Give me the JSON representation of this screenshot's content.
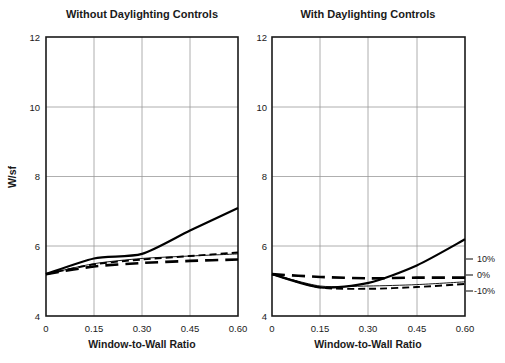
{
  "figure": {
    "width": 505,
    "height": 363,
    "background": "#ffffff",
    "ink_color": "#1a1a1a",
    "grid_color": "#9a9a9a"
  },
  "chart_data": [
    {
      "type": "line",
      "title": "Without Daylighting Controls",
      "xlabel": "Window-to-Wall Ratio",
      "ylabel": "W/sf",
      "xlim": [
        0,
        0.6
      ],
      "ylim": [
        4,
        12
      ],
      "xticks": [
        0,
        0.15,
        0.3,
        0.45,
        0.6
      ],
      "xticklabels": [
        "0",
        "0.15",
        "0.30",
        "0.45",
        "0.60"
      ],
      "yticks": [
        4,
        6,
        8,
        10,
        12
      ],
      "yticklabels": [
        "4",
        "6",
        "8",
        "10",
        "12"
      ],
      "grid": true,
      "legend": "none",
      "x": [
        0,
        0.15,
        0.3,
        0.45,
        0.6
      ],
      "series": [
        {
          "name": "thick-solid",
          "style": "thick-solid",
          "values": [
            5.2,
            5.65,
            5.78,
            6.45,
            7.1
          ]
        },
        {
          "name": "thin-solid",
          "style": "thin-solid",
          "values": [
            5.2,
            5.5,
            5.65,
            5.72,
            5.78
          ]
        },
        {
          "name": "short-dash",
          "style": "short-dash",
          "values": [
            5.2,
            5.48,
            5.62,
            5.72,
            5.82
          ]
        },
        {
          "name": "long-dash",
          "style": "long-dash",
          "values": [
            5.2,
            5.42,
            5.52,
            5.58,
            5.62
          ]
        }
      ]
    },
    {
      "type": "line",
      "title": "With Daylighting Controls",
      "xlabel": "Window-to-Wall Ratio",
      "ylabel": "",
      "xlim": [
        0,
        0.6
      ],
      "ylim": [
        4,
        12
      ],
      "xticks": [
        0,
        0.15,
        0.3,
        0.45,
        0.6
      ],
      "xticklabels": [
        "0",
        "0.15",
        "0.30",
        "0.45",
        "0.60"
      ],
      "yticks": [
        4,
        6,
        8,
        10,
        12
      ],
      "yticklabels": [
        "4",
        "6",
        "8",
        "10",
        "12"
      ],
      "grid": true,
      "legend": "none",
      "x": [
        0,
        0.15,
        0.3,
        0.45,
        0.6
      ],
      "series": [
        {
          "name": "thick-solid",
          "style": "thick-solid",
          "values": [
            5.2,
            4.82,
            4.95,
            5.45,
            6.2
          ]
        },
        {
          "name": "thin-solid",
          "style": "thin-solid",
          "values": [
            5.2,
            4.86,
            4.86,
            4.9,
            4.98
          ]
        },
        {
          "name": "short-dash",
          "style": "short-dash",
          "values": [
            5.2,
            4.82,
            4.78,
            4.83,
            4.92
          ]
        },
        {
          "name": "long-dash",
          "style": "long-dash",
          "values": [
            5.2,
            5.12,
            5.08,
            5.1,
            5.1
          ]
        }
      ],
      "right_annotations": [
        {
          "label": "10%",
          "y_value": 5.55
        },
        {
          "label": "0%",
          "y_value": 5.1
        },
        {
          "label": "-10%",
          "y_value": 4.72
        }
      ]
    }
  ]
}
